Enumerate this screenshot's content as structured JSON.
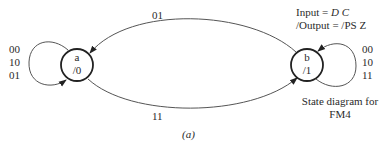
{
  "diagram": {
    "type": "state-diagram",
    "legend": {
      "input_label": "Input",
      "input_eq": "=",
      "input_value": "D C",
      "output_label": "/Output",
      "output_eq": "=",
      "output_value": "/PS Z"
    },
    "caption_line1": "State diagram for",
    "caption_line2": "FM4",
    "figure_label": "(a)",
    "states": [
      {
        "id": "a",
        "name": "a",
        "output": "/0"
      },
      {
        "id": "b",
        "name": "b",
        "output": "/1"
      }
    ],
    "transitions": [
      {
        "from": "b",
        "to": "a",
        "label": "01"
      },
      {
        "from": "a",
        "to": "b",
        "label": "11"
      },
      {
        "from": "a",
        "to": "a",
        "labels": [
          "00",
          "10",
          "01"
        ]
      },
      {
        "from": "b",
        "to": "b",
        "labels": [
          "00",
          "10",
          "11"
        ]
      }
    ]
  }
}
